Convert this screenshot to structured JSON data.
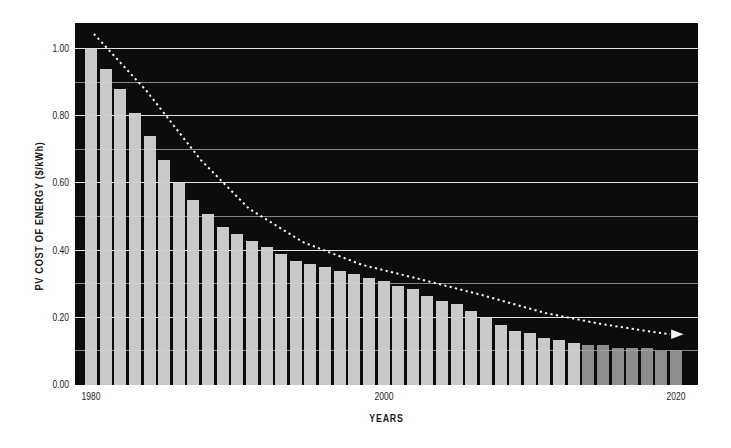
{
  "chart_data": {
    "type": "bar",
    "title": "",
    "xlabel": "YEARS",
    "ylabel": "PV COST OF ENERGY ($/kWh)",
    "x_tick_labels": [
      "1980",
      "2000",
      "2020"
    ],
    "x_tick_years": [
      1980,
      2000,
      2020
    ],
    "y_tick_labels": [
      "1.00",
      "0.80",
      "0.60",
      "0.40",
      "0.20",
      "0.00"
    ],
    "y_tick_values": [
      1.0,
      0.8,
      0.6,
      0.4,
      0.2,
      0.0
    ],
    "ylim": [
      0,
      1.08
    ],
    "grid": {
      "orientation": "horizontal",
      "minor_every": 0.1,
      "major_every": 0.2
    },
    "categories": [
      1980,
      1981,
      1982,
      1983,
      1984,
      1985,
      1986,
      1987,
      1988,
      1989,
      1990,
      1991,
      1992,
      1993,
      1994,
      1995,
      1996,
      1997,
      1998,
      1999,
      2000,
      2001,
      2002,
      2003,
      2004,
      2005,
      2006,
      2007,
      2008,
      2009,
      2010,
      2011,
      2012,
      2013,
      2014,
      2015,
      2016,
      2017,
      2018,
      2019,
      2020
    ],
    "values": [
      1.0,
      0.94,
      0.88,
      0.81,
      0.74,
      0.67,
      0.6,
      0.55,
      0.51,
      0.47,
      0.45,
      0.43,
      0.41,
      0.39,
      0.37,
      0.36,
      0.35,
      0.34,
      0.33,
      0.32,
      0.31,
      0.295,
      0.285,
      0.265,
      0.25,
      0.24,
      0.22,
      0.2,
      0.18,
      0.16,
      0.155,
      0.14,
      0.135,
      0.125,
      0.12,
      0.12,
      0.11,
      0.11,
      0.11,
      0.1,
      0.105
    ],
    "colors": {
      "page_bg": "#ffffff",
      "plot_bg": "#0c0c0c",
      "bar_historical": "#c9c9c9",
      "bar_projected": "#8d8d8d",
      "gridline": "#ffffff",
      "trend": "#f5f5f5",
      "text": "#1b1b1b"
    },
    "projected_start_year": 2014,
    "trend_line": {
      "style": "dotted",
      "arrow_end": true,
      "points": [
        [
          1980.2,
          1.045
        ],
        [
          1983.8,
          0.875
        ],
        [
          1987.5,
          0.67
        ],
        [
          1990.8,
          0.525
        ],
        [
          1994.5,
          0.425
        ],
        [
          1998.5,
          0.358
        ],
        [
          2002.5,
          0.315
        ],
        [
          2006.8,
          0.267
        ],
        [
          2011.0,
          0.215
        ],
        [
          2014.7,
          0.183
        ],
        [
          2017.8,
          0.162
        ],
        [
          2019.6,
          0.151
        ]
      ]
    },
    "legend": "none"
  }
}
